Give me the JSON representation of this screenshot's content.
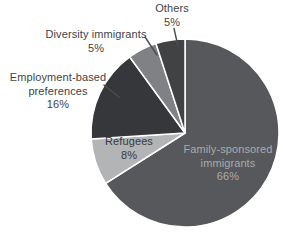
{
  "chart_data": {
    "type": "pie",
    "title": "",
    "unit": "percent",
    "direction": "clockwise",
    "start_angle_deg": 0,
    "legend": "none",
    "slices": [
      {
        "key": "family-sponsored-immigrants",
        "name": "Family-sponsored immigrants",
        "line1": "Family-sponsored",
        "line2": "immigrants",
        "pct": 66,
        "pct_label": "66%",
        "color": "#56585b",
        "label_placement": "inside",
        "label_text_color": "#a9abad"
      },
      {
        "key": "refugees",
        "name": "Refugees",
        "pct": 8,
        "pct_label": "8%",
        "color": "#b2b4b6",
        "label_placement": "inside",
        "label_text_color": "#37393b"
      },
      {
        "key": "employment-based-preferences",
        "name": "Employment-based preferences",
        "line1": "Employment-based",
        "line2": "preferences",
        "pct": 16,
        "pct_label": "16%",
        "color": "#35373a",
        "label_placement": "outside"
      },
      {
        "key": "diversity-immigrants",
        "name": "Diversity immigrants",
        "pct": 5,
        "pct_label": "5%",
        "color": "#7f8184",
        "label_placement": "outside"
      },
      {
        "key": "others",
        "name": "Others",
        "pct": 5,
        "pct_label": "5%",
        "color": "#404244",
        "label_placement": "outside"
      }
    ],
    "outside_label_color": "#424446",
    "leader_line_color": "#4a4c4e"
  }
}
